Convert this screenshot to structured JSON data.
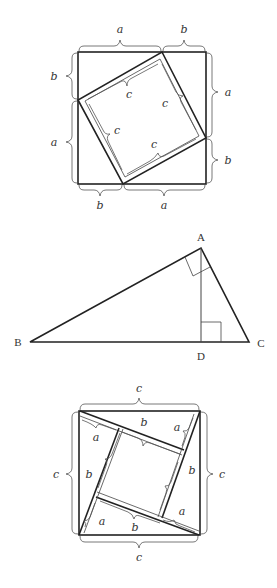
{
  "diagram1": {
    "title": "Square of side a+b with inscribed tilted square of side c",
    "labels": {
      "top_left": "a",
      "top_right": "b",
      "left_top": "b",
      "left_bottom": "a",
      "right_top": "a",
      "right_bottom": "b",
      "bottom_left": "b",
      "bottom_right": "a",
      "inner_top": "c",
      "inner_right": "c",
      "inner_left": "c",
      "inner_bottom": "c"
    }
  },
  "diagram2": {
    "title": "Right triangle ABC with altitude AD",
    "vertices": {
      "A": "A",
      "B": "B",
      "C": "C",
      "D": "D"
    }
  },
  "diagram3": {
    "title": "Square of side c partitioned into four triangles and inner square",
    "labels": {
      "top": "c",
      "bottom": "c",
      "left": "c",
      "right": "c",
      "a1": "a",
      "b1": "b",
      "a2": "a",
      "b2": "b",
      "b3": "b",
      "a3": "a",
      "a4": "a",
      "b4": "b"
    }
  }
}
